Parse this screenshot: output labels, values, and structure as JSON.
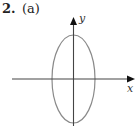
{
  "problem": {
    "number": "2.",
    "part": "(a)"
  },
  "axes": {
    "x_label": "x",
    "y_label": "y",
    "axis_color": "#444444"
  },
  "ellipse": {
    "shape": "vertical ellipse centered at origin",
    "stroke_color": "#888888"
  }
}
